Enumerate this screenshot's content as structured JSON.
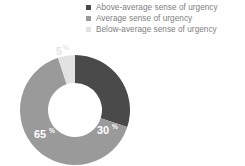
{
  "chart_data": {
    "type": "pie",
    "variant": "donut",
    "title": "",
    "subtitle": "",
    "xlabel": "",
    "ylabel": "",
    "grid": false,
    "legend_position": "top-right",
    "units": "%",
    "start_angle_deg": 0,
    "direction": "clockwise",
    "categories": [
      "Above-average sense of urgency",
      "Average sense of urgency",
      "Below-average sense of urgency"
    ],
    "values": [
      30,
      65,
      5
    ],
    "slices": [
      {
        "label": "Above-average sense of urgency",
        "value": 30,
        "value_text": "30",
        "unit_text": "%",
        "color": "#4a4a4a",
        "label_placement": "inside",
        "label_color": "#ffffff"
      },
      {
        "label": "Average sense of urgency",
        "value": 65,
        "value_text": "65",
        "unit_text": "%",
        "color": "#9a9a9a",
        "label_placement": "inside",
        "label_color": "#ffffff"
      },
      {
        "label": "Below-average sense of urgency",
        "value": 5,
        "value_text": "5",
        "unit_text": "%",
        "color": "#e2e2e2",
        "label_placement": "outside",
        "label_color": "#e4e4e4"
      }
    ]
  },
  "legend": {
    "items": [
      {
        "label": "Above-average sense of urgency",
        "color": "#4a4a4a"
      },
      {
        "label": "Average sense of urgency",
        "color": "#9a9a9a"
      },
      {
        "label": "Below-average sense of urgency",
        "color": "#e2e2e2"
      }
    ]
  },
  "colors": {
    "above_average": "#4a4a4a",
    "average": "#9a9a9a",
    "below_average": "#e2e2e2",
    "legend_text": "#7e7e7e",
    "background": "#ffffff",
    "inside_label": "#ffffff"
  }
}
